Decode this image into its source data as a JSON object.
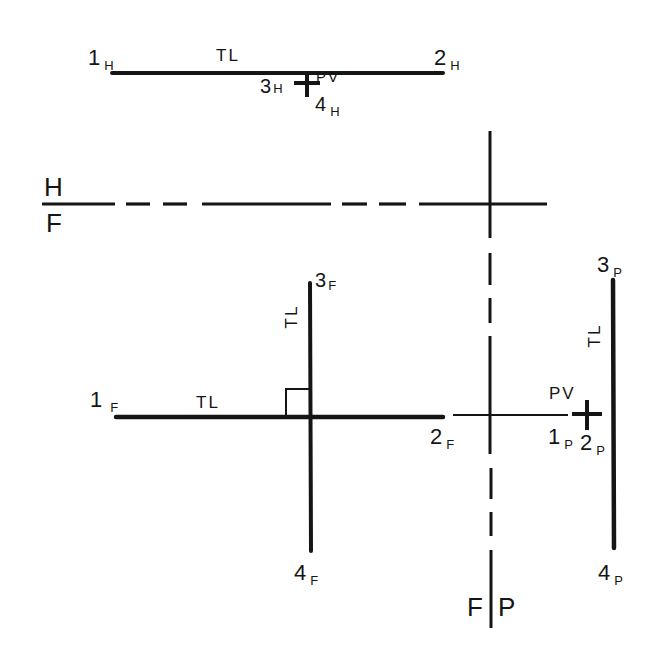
{
  "figure": {
    "type": "orthographic projection",
    "views": [
      "H",
      "F",
      "P"
    ]
  },
  "fold_lines": {
    "hf": {
      "top_label": "H",
      "bottom_label": "F"
    },
    "fp": {
      "left_label": "F",
      "right_label": "P"
    }
  },
  "horizontal_view": {
    "p1": {
      "num": "1",
      "sub": "H"
    },
    "p2": {
      "num": "2",
      "sub": "H"
    },
    "p3": {
      "num": "3",
      "sub": "H"
    },
    "p4": {
      "num": "4",
      "sub": "H"
    },
    "line12_label": "TL",
    "point_view_label": "PV"
  },
  "front_view": {
    "p1": {
      "num": "1",
      "sub": "F"
    },
    "p2": {
      "num": "2",
      "sub": "F"
    },
    "p3": {
      "num": "3",
      "sub": "F"
    },
    "p4": {
      "num": "4",
      "sub": "F"
    },
    "line12_label": "TL",
    "line34_label": "TL"
  },
  "profile_view": {
    "p1": {
      "num": "1",
      "sub": "P"
    },
    "p2": {
      "num": "2",
      "sub": "P"
    },
    "p3": {
      "num": "3",
      "sub": "P"
    },
    "p4": {
      "num": "4",
      "sub": "P"
    },
    "line34_label": "TL",
    "point_view_label": "PV"
  },
  "colors": {
    "ink": "#151515",
    "background": "#ffffff"
  }
}
